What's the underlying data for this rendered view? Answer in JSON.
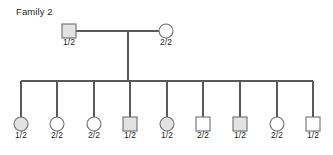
{
  "title": "Family 2",
  "colors": {
    "affected_fill": "#e2e2e2",
    "unaffected_fill": "#ffffff",
    "symbol_stroke": "#6d6e71",
    "line_stroke": "#58595b",
    "text": "#231f20"
  },
  "generations": [
    {
      "name": "parents",
      "members": [
        {
          "id": "father",
          "sex": "male",
          "shape": "square",
          "filled": true,
          "genotype": "1/2",
          "cx": 69,
          "cy": 31
        },
        {
          "id": "mother",
          "sex": "female",
          "shape": "circle",
          "filled": false,
          "genotype": "2/2",
          "cx": 166,
          "cy": 31
        }
      ]
    },
    {
      "name": "children",
      "members": [
        {
          "id": "child-1",
          "sex": "female",
          "shape": "circle",
          "filled": true,
          "genotype": "1/2",
          "cx": 21,
          "cy": 124
        },
        {
          "id": "child-2",
          "sex": "female",
          "shape": "circle",
          "filled": false,
          "genotype": "2/2",
          "cx": 57,
          "cy": 124
        },
        {
          "id": "child-3",
          "sex": "female",
          "shape": "circle",
          "filled": false,
          "genotype": "2/2",
          "cx": 94,
          "cy": 124
        },
        {
          "id": "child-4",
          "sex": "male",
          "shape": "square",
          "filled": true,
          "genotype": "1/2",
          "cx": 130,
          "cy": 124
        },
        {
          "id": "child-5",
          "sex": "female",
          "shape": "circle",
          "filled": true,
          "genotype": "1/2",
          "cx": 167,
          "cy": 124
        },
        {
          "id": "child-6",
          "sex": "male",
          "shape": "square",
          "filled": false,
          "genotype": "2/2",
          "cx": 203,
          "cy": 124
        },
        {
          "id": "child-7",
          "sex": "male",
          "shape": "square",
          "filled": true,
          "genotype": "1/2",
          "cx": 240,
          "cy": 124
        },
        {
          "id": "child-8",
          "sex": "female",
          "shape": "circle",
          "filled": false,
          "genotype": "2/2",
          "cx": 277,
          "cy": 124
        },
        {
          "id": "child-9",
          "sex": "male",
          "shape": "square",
          "filled": false,
          "genotype": "1/2",
          "cx": 313,
          "cy": 124
        }
      ]
    }
  ],
  "geometry": {
    "symbol_size": 14,
    "label_offset_y": 14,
    "union_line_y": 31,
    "union_line_x1": 76,
    "union_line_x2": 159,
    "descent_x": 128,
    "descent_y1": 31,
    "descent_y2": 81,
    "sibship_bar_y": 81,
    "sibship_bar_x1": 21,
    "sibship_bar_x2": 313,
    "sibship_drop_y2": 117
  }
}
